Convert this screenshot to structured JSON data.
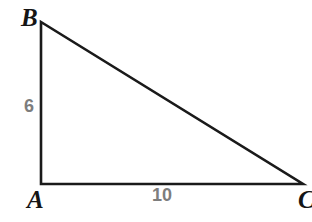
{
  "figure": {
    "type": "geometry-diagram",
    "shape": "right-triangle",
    "background_color": "#ffffff",
    "width": 312,
    "height": 222
  },
  "geometry": {
    "stroke_color": "#1a1a1a",
    "stroke_width": 2.6,
    "vertices": [
      {
        "name": "A",
        "x": 41,
        "y": 184
      },
      {
        "name": "B",
        "x": 41,
        "y": 22
      },
      {
        "name": "C",
        "x": 303,
        "y": 184
      }
    ],
    "path": "M 41 22 L 41 184 L 303 184 Z"
  },
  "labels": {
    "vertices": {
      "b": "B",
      "a": "A",
      "c": "C"
    },
    "sides": {
      "leg_vertical": "6",
      "leg_horizontal": "10"
    },
    "vertex_color": "#151515",
    "side_color": "#7d7d7d"
  },
  "chart_data": {
    "type": "table",
    "title": "",
    "categories": [
      "AB",
      "AC"
    ],
    "values": [
      6,
      10
    ],
    "xlabel": "",
    "ylabel": "",
    "annotations": [
      "A",
      "B",
      "C",
      "6",
      "10"
    ]
  }
}
